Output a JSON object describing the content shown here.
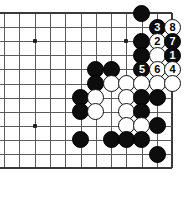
{
  "board": {
    "title": "go-board-diagram",
    "cols": 12,
    "rows": 12,
    "origin_x": 4,
    "origin_y": 13,
    "spacing_x": 15.3,
    "spacing_y": 14.1,
    "line_color": "#5a5a5a",
    "edge_color": "#3a3a3a",
    "background": "#ffffff",
    "black_color": "#0d0d0d",
    "white_color": "#ffffff",
    "edges": {
      "top": true,
      "right": true,
      "bottom": true,
      "left": false
    },
    "hoshi": [
      {
        "c": 2,
        "r": 2
      },
      {
        "c": 8,
        "r": 2
      },
      {
        "c": 2,
        "r": 8
      }
    ],
    "stones": [
      {
        "c": 9,
        "r": 0,
        "color": "black",
        "label": ""
      },
      {
        "c": 10,
        "r": 1,
        "color": "black",
        "label": "3"
      },
      {
        "c": 11,
        "r": 1,
        "color": "white",
        "label": "8"
      },
      {
        "c": 9,
        "r": 2,
        "color": "black",
        "label": ""
      },
      {
        "c": 10,
        "r": 2,
        "color": "white",
        "label": "2"
      },
      {
        "c": 11,
        "r": 2,
        "color": "black",
        "label": "7"
      },
      {
        "c": 9,
        "r": 3,
        "color": "black",
        "label": ""
      },
      {
        "c": 10,
        "r": 3,
        "color": "white",
        "label": ""
      },
      {
        "c": 11,
        "r": 3,
        "color": "black",
        "label": "1"
      },
      {
        "c": 6,
        "r": 4,
        "color": "black",
        "label": ""
      },
      {
        "c": 7,
        "r": 4,
        "color": "black",
        "label": ""
      },
      {
        "c": 9,
        "r": 4,
        "color": "black",
        "label": "5"
      },
      {
        "c": 10,
        "r": 4,
        "color": "white",
        "label": "6"
      },
      {
        "c": 11,
        "r": 4,
        "color": "white",
        "label": "4"
      },
      {
        "c": 6,
        "r": 5,
        "color": "black",
        "label": ""
      },
      {
        "c": 7,
        "r": 5,
        "color": "white",
        "label": ""
      },
      {
        "c": 8,
        "r": 5,
        "color": "white",
        "label": ""
      },
      {
        "c": 9,
        "r": 5,
        "color": "white",
        "label": ""
      },
      {
        "c": 10,
        "r": 5,
        "color": "white",
        "label": ""
      },
      {
        "c": 11,
        "r": 5,
        "color": "white",
        "label": ""
      },
      {
        "c": 5,
        "r": 6,
        "color": "black",
        "label": ""
      },
      {
        "c": 6,
        "r": 6,
        "color": "white",
        "label": ""
      },
      {
        "c": 8,
        "r": 6,
        "color": "white",
        "label": ""
      },
      {
        "c": 9,
        "r": 6,
        "color": "black",
        "label": ""
      },
      {
        "c": 10,
        "r": 6,
        "color": "black",
        "label": ""
      },
      {
        "c": 5,
        "r": 7,
        "color": "black",
        "label": ""
      },
      {
        "c": 6,
        "r": 7,
        "color": "white",
        "label": ""
      },
      {
        "c": 8,
        "r": 7,
        "color": "white",
        "label": ""
      },
      {
        "c": 9,
        "r": 7,
        "color": "black",
        "label": ""
      },
      {
        "c": 8,
        "r": 8,
        "color": "white",
        "label": ""
      },
      {
        "c": 9,
        "r": 8,
        "color": "white",
        "label": ""
      },
      {
        "c": 10,
        "r": 8,
        "color": "black",
        "label": ""
      },
      {
        "c": 5,
        "r": 9,
        "color": "black",
        "label": ""
      },
      {
        "c": 7,
        "r": 9,
        "color": "black",
        "label": ""
      },
      {
        "c": 8,
        "r": 9,
        "color": "black",
        "label": ""
      },
      {
        "c": 9,
        "r": 9,
        "color": "black",
        "label": ""
      },
      {
        "c": 10,
        "r": 10,
        "color": "black",
        "label": ""
      }
    ]
  }
}
